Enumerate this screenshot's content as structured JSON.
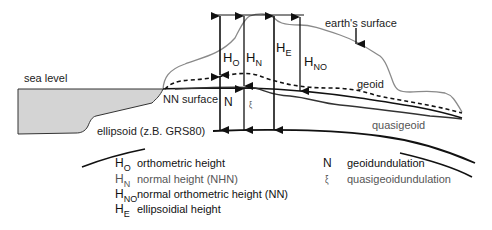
{
  "labels": {
    "sea_level": "sea level",
    "earths_surface": "earth's surface",
    "geoid": "geoid",
    "nn_surface": "NN surface",
    "quasigeoid": "quasigeoid",
    "ellipsoid": "ellipsoid (z.B. GRS80)"
  },
  "height_symbols": {
    "ho": {
      "base": "H",
      "sub": "O"
    },
    "hn": {
      "base": "H",
      "sub": "N"
    },
    "he": {
      "base": "H",
      "sub": "E"
    },
    "hno": {
      "base": "H",
      "sub": "NO"
    },
    "n": "N",
    "xi": "ξ"
  },
  "legend": {
    "left": [
      {
        "base": "H",
        "sub": "O",
        "text": "orthometric height"
      },
      {
        "base": "H",
        "sub": "N",
        "text": "normal height (NHN)"
      },
      {
        "base": "H",
        "sub": "NO",
        "text": "normal orthometric height (NN)"
      },
      {
        "base": "H",
        "sub": "E",
        "text": "ellipsoidial height"
      }
    ],
    "right": [
      {
        "symbol": "N",
        "text": "geoidundulation"
      },
      {
        "symbol": "ξ",
        "text": "quasigeoidundulation"
      }
    ]
  },
  "colors": {
    "sea_fill": "#d4d4d4",
    "earth_surface_line": "#8a8a8a",
    "geoid_line": "#111111",
    "quasigeoid_line": "#333333",
    "ellipsoid_line": "#111111",
    "arrow": "#111111"
  }
}
